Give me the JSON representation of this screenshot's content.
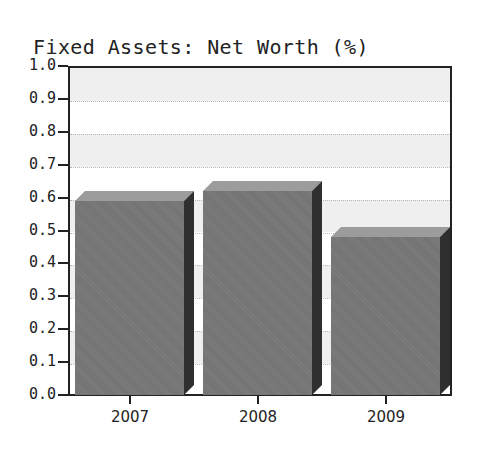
{
  "chart_data": {
    "type": "bar",
    "title": "Fixed Assets: Net Worth (%)",
    "categories": [
      "2007",
      "2008",
      "2009"
    ],
    "values": [
      0.59,
      0.62,
      0.48
    ],
    "xlabel": "",
    "ylabel": "",
    "ylim": [
      0.0,
      1.0
    ],
    "yticks": [
      "0.0",
      "0.1",
      "0.2",
      "0.3",
      "0.4",
      "0.5",
      "0.6",
      "0.7",
      "0.8",
      "0.9",
      "1.0"
    ],
    "grid": true,
    "legend": null,
    "style": "3d-bar",
    "colors": {
      "bar_front": "#7c7c7c",
      "bar_top": "#9c9c9c",
      "bar_side": "#2f2f2f",
      "band": "#efefef",
      "axis": "#222222"
    }
  }
}
